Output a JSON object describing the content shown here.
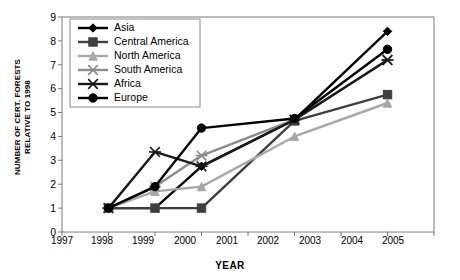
{
  "chart_data": {
    "type": "line",
    "title": "",
    "xlabel": "YEAR",
    "ylabel": "NUMBER OF CERT. FORESTS RELATIVE TO 1998",
    "ylabel_lines": [
      "NUMBER OF CERT. FORESTS",
      "RELATIVE TO 1998"
    ],
    "x": [
      1998,
      1999,
      2000,
      2002,
      2004
    ],
    "xlim": [
      1997,
      2005
    ],
    "ylim": [
      0,
      9
    ],
    "xticks": [
      1997,
      1998,
      1999,
      2000,
      2001,
      2002,
      2003,
      2004,
      2005
    ],
    "yticks": [
      0,
      1,
      2,
      3,
      4,
      5,
      6,
      7,
      8,
      9
    ],
    "grid": false,
    "legend_position": "upper-left-inside",
    "series": [
      {
        "name": "Asia",
        "marker": "diamond",
        "color": "#000000",
        "values": [
          1.0,
          1.0,
          2.75,
          4.7,
          8.4
        ]
      },
      {
        "name": "Central America",
        "marker": "square",
        "color": "#3f3f3f",
        "values": [
          1.0,
          1.0,
          1.0,
          4.65,
          5.75
        ]
      },
      {
        "name": "North America",
        "marker": "triangle",
        "color": "#a8a8a8",
        "values": [
          1.0,
          1.7,
          1.9,
          4.0,
          5.4
        ]
      },
      {
        "name": "South America",
        "marker": "cross",
        "color": "#8c8c8c",
        "values": [
          1.0,
          1.9,
          3.2,
          4.7,
          7.2
        ]
      },
      {
        "name": "Africa",
        "marker": "cross",
        "color": "#1a1a1a",
        "values": [
          1.0,
          3.35,
          2.75,
          4.7,
          7.2
        ]
      },
      {
        "name": "Europe",
        "marker": "circle",
        "color": "#000000",
        "values": [
          1.0,
          1.9,
          4.35,
          4.75,
          7.65
        ]
      }
    ]
  },
  "legend": {
    "entries": [
      {
        "label": "Asia"
      },
      {
        "label": "Central America"
      },
      {
        "label": "North America"
      },
      {
        "label": "South America"
      },
      {
        "label": "Africa"
      },
      {
        "label": "Europe"
      }
    ]
  },
  "axis": {
    "x_tick_labels": [
      "1997",
      "1998",
      "1999",
      "2000",
      "2001",
      "2002",
      "2003",
      "2004",
      "2005"
    ],
    "y_tick_labels": [
      "0",
      "1",
      "2",
      "3",
      "4",
      "5",
      "6",
      "7",
      "8",
      "9"
    ],
    "x_title": "YEAR",
    "y_title_line1": "NUMBER OF CERT. FORESTS",
    "y_title_line2": "RELATIVE TO 1998"
  }
}
